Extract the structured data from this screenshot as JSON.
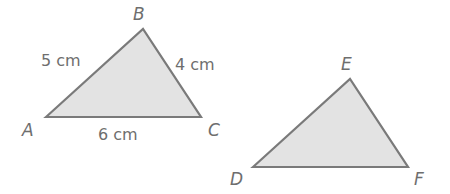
{
  "diagram": {
    "triangle_abc": {
      "vertices": {
        "A": {
          "label": "A",
          "x": 46,
          "y": 117
        },
        "B": {
          "label": "B",
          "x": 143,
          "y": 29
        },
        "C": {
          "label": "C",
          "x": 201,
          "y": 117
        }
      },
      "sides": {
        "AB": "5 cm",
        "BC": "4 cm",
        "AC": "6 cm"
      },
      "fill": "#e3e3e3",
      "stroke": "#7a7a7a"
    },
    "triangle_def": {
      "vertices": {
        "D": {
          "label": "D",
          "x": 253,
          "y": 167
        },
        "E": {
          "label": "E",
          "x": 350,
          "y": 79
        },
        "F": {
          "label": "F",
          "x": 408,
          "y": 167
        }
      },
      "fill": "#e3e3e3",
      "stroke": "#7a7a7a"
    }
  }
}
